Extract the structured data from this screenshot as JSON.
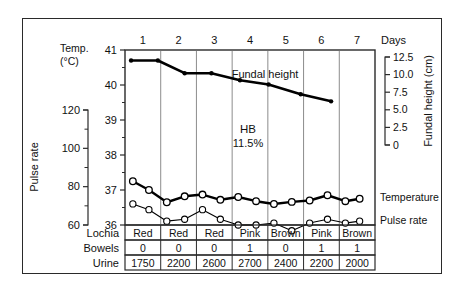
{
  "chart_data": {
    "type": "line",
    "xlabel": "Days",
    "x": [
      1,
      2,
      3,
      4,
      5,
      6,
      7
    ],
    "x_tick_labels": [
      "1",
      "2",
      "3",
      "4",
      "5",
      "6",
      "7"
    ],
    "days_label": "Days",
    "grid": true,
    "axes": [
      {
        "name": "temperature",
        "label": "Temp.",
        "unit_label": "(°C)",
        "side": "left-inner",
        "ticks": [
          41,
          40,
          39,
          38,
          37,
          36
        ],
        "tick_labels": [
          "41",
          "40",
          "39",
          "38",
          "37",
          "36"
        ],
        "ylim": [
          36,
          41
        ]
      },
      {
        "name": "pulse",
        "label": "Pulse rate",
        "side": "left-outer",
        "ticks": [
          120,
          100,
          80,
          60
        ],
        "tick_labels": [
          "120",
          "100",
          "80",
          "60"
        ],
        "ylim": [
          60,
          120
        ]
      },
      {
        "name": "fundal_height",
        "label": "Fundal height (cm)",
        "side": "right",
        "ticks": [
          12.5,
          10.0,
          7.5,
          5.0,
          2.5,
          0
        ],
        "tick_labels": [
          "12.5",
          "10.0",
          "7.5",
          "5.0",
          "2.5",
          "0"
        ],
        "ylim": [
          0,
          12.5
        ]
      }
    ],
    "series": [
      {
        "name": "Fundal height",
        "label": "Fundal height",
        "axis": "fundal_height",
        "marker": "filled-dot",
        "line": "thick",
        "color": "#000000",
        "x": [
          1.1,
          1.85,
          2.6,
          3.35,
          4.15,
          4.95,
          5.85,
          6.7
        ],
        "values": [
          12.0,
          12.0,
          10.2,
          10.2,
          9.2,
          8.6,
          7.2,
          6.2
        ]
      },
      {
        "name": "Temperature",
        "label": "Temperature",
        "axis": "temperature",
        "marker": "open-circle",
        "line": "thick",
        "color": "#000000",
        "x": [
          1.15,
          1.6,
          2.1,
          2.6,
          3.1,
          3.6,
          4.1,
          4.6,
          5.1,
          5.6,
          6.1,
          6.6,
          7.1,
          7.5
        ],
        "values": [
          37.25,
          37.0,
          36.65,
          36.82,
          36.87,
          36.72,
          36.8,
          36.68,
          36.6,
          36.66,
          36.7,
          36.85,
          36.68,
          36.75
        ]
      },
      {
        "name": "Pulse rate",
        "label": "Pulse rate",
        "axis": "pulse",
        "marker": "open-circle",
        "line": "thin",
        "color": "#000000",
        "x": [
          1.15,
          1.6,
          2.1,
          2.6,
          3.1,
          3.6,
          4.1,
          4.6,
          5.1,
          5.6,
          6.1,
          6.6,
          7.1,
          7.5
        ],
        "values": [
          71,
          68,
          62,
          63,
          68,
          63,
          60,
          60,
          61,
          57,
          61,
          63,
          61,
          62
        ]
      }
    ],
    "annotations": [
      {
        "name": "hb-annotation",
        "line1": "HB",
        "line2": "11.5%"
      }
    ],
    "table": {
      "rows": [
        {
          "name": "lochia",
          "label": "Lochia",
          "values": [
            "Red",
            "Red",
            "Red",
            "Pink",
            "Brown",
            "Pink",
            "Brown"
          ]
        },
        {
          "name": "bowels",
          "label": "Bowels",
          "values": [
            "0",
            "0",
            "0",
            "1",
            "0",
            "1",
            "1"
          ]
        },
        {
          "name": "urine",
          "label": "Urine",
          "values": [
            "1750",
            "2200",
            "2600",
            "2700",
            "2400",
            "2200",
            "2000"
          ]
        }
      ]
    }
  },
  "colors": {
    "line": "#000000",
    "frame": "#2a2a2a",
    "grid": "#6e6e6e",
    "text": "#111111",
    "background": "#ffffff"
  }
}
